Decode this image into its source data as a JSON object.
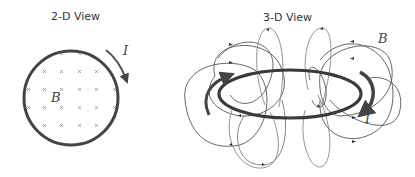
{
  "panels": {
    "left": {
      "title": "2-D View",
      "current_label": "I",
      "field_label": "B",
      "field_marker": "×",
      "field_direction": "into page"
    },
    "right": {
      "title": "3-D View",
      "current_label": "I",
      "field_label": "B"
    }
  },
  "colors": {
    "loop": "#444444",
    "field_lines": "#555555",
    "field_lines_light": "#888888",
    "markers": "#888888",
    "text": "#333333"
  }
}
